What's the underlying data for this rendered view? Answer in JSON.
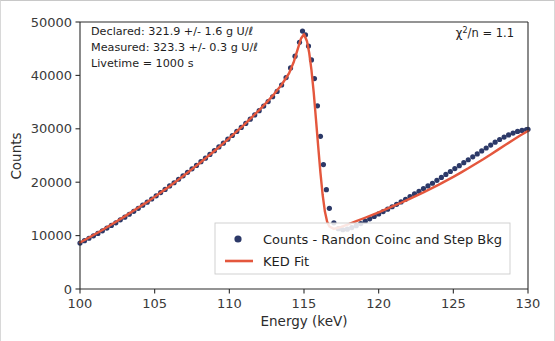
{
  "figure": {
    "background_color": "#ffffff",
    "axes_color": "#2b2b2b"
  },
  "chart_data": {
    "type": "line",
    "title": "",
    "xlabel": "Energy (keV)",
    "ylabel": "Counts",
    "xlim": [
      100,
      130
    ],
    "ylim": [
      0,
      50000
    ],
    "xticks": [
      100,
      105,
      110,
      115,
      120,
      125,
      130
    ],
    "yticks": [
      0,
      10000,
      20000,
      30000,
      40000,
      50000
    ],
    "xtick_labels": [
      "100",
      "105",
      "110",
      "115",
      "120",
      "125",
      "130"
    ],
    "ytick_labels": [
      "0",
      "10000",
      "20000",
      "30000",
      "40000",
      "50000"
    ],
    "grid": false,
    "legend_position": "lower center",
    "series": [
      {
        "name": "Counts - Randon Coinc and Step Bkg",
        "type": "scatter",
        "color": "#2c3968",
        "marker": "circle",
        "x": [
          100.0,
          100.3,
          100.6,
          100.9,
          101.2,
          101.5,
          101.8,
          102.1,
          102.4,
          102.7,
          103.0,
          103.3,
          103.6,
          103.9,
          104.2,
          104.5,
          104.8,
          105.1,
          105.4,
          105.7,
          106.0,
          106.3,
          106.6,
          106.9,
          107.2,
          107.5,
          107.8,
          108.1,
          108.4,
          108.7,
          109.0,
          109.3,
          109.6,
          109.9,
          110.2,
          110.5,
          110.8,
          111.1,
          111.4,
          111.7,
          112.0,
          112.3,
          112.6,
          112.9,
          113.2,
          113.5,
          113.8,
          114.1,
          114.4,
          114.7,
          114.9,
          115.1,
          115.3,
          115.5,
          115.7,
          115.9,
          116.1,
          116.3,
          116.5,
          116.7,
          117.0,
          117.3,
          117.6,
          117.9,
          118.2,
          118.5,
          118.8,
          119.1,
          119.4,
          119.7,
          120.0,
          120.3,
          120.6,
          120.9,
          121.2,
          121.5,
          121.8,
          122.1,
          122.4,
          122.7,
          123.0,
          123.3,
          123.6,
          123.9,
          124.2,
          124.5,
          124.8,
          125.1,
          125.4,
          125.7,
          126.0,
          126.3,
          126.6,
          126.9,
          127.2,
          127.5,
          127.8,
          128.1,
          128.4,
          128.7,
          129.0,
          129.3,
          129.6,
          129.9,
          130.0
        ],
        "y": [
          8600,
          9050,
          9500,
          9950,
          10400,
          10900,
          11400,
          11900,
          12400,
          12950,
          13450,
          14000,
          14550,
          15100,
          15700,
          16250,
          16850,
          17450,
          18050,
          18650,
          19300,
          19900,
          20550,
          21200,
          21850,
          22500,
          23150,
          23850,
          24500,
          25200,
          25900,
          26600,
          27300,
          28050,
          28750,
          29500,
          30250,
          31000,
          31800,
          32600,
          33400,
          34250,
          35100,
          36000,
          37000,
          38200,
          39600,
          41400,
          43600,
          46200,
          48300,
          47600,
          45500,
          42900,
          39400,
          34300,
          28600,
          23300,
          18600,
          15100,
          12400,
          11300,
          11100,
          11200,
          11500,
          11850,
          12250,
          12700,
          13150,
          13600,
          14050,
          14500,
          14950,
          15400,
          15850,
          16300,
          16800,
          17300,
          17800,
          18300,
          18800,
          19300,
          19800,
          20350,
          20900,
          21450,
          22000,
          22550,
          23100,
          23650,
          24200,
          24750,
          25300,
          25850,
          26400,
          26950,
          27500,
          28000,
          28450,
          28850,
          29200,
          29500,
          29700,
          29850,
          29900
        ]
      },
      {
        "name": "KED Fit",
        "type": "line",
        "color": "#e4573d",
        "x": [
          100.0,
          100.5,
          101.0,
          101.5,
          102.0,
          102.5,
          103.0,
          103.5,
          104.0,
          104.5,
          105.0,
          105.5,
          106.0,
          106.5,
          107.0,
          107.5,
          108.0,
          108.5,
          109.0,
          109.5,
          110.0,
          110.5,
          111.0,
          111.5,
          112.0,
          112.5,
          113.0,
          113.5,
          114.0,
          114.3,
          114.6,
          114.8,
          115.0,
          115.2,
          115.35,
          115.5,
          115.65,
          115.8,
          115.95,
          116.1,
          116.25,
          116.4,
          116.55,
          116.7,
          117.0,
          117.5,
          118.0,
          118.5,
          119.0,
          119.5,
          120.0,
          120.5,
          121.0,
          121.5,
          122.0,
          122.5,
          123.0,
          123.5,
          124.0,
          124.5,
          125.0,
          125.5,
          126.0,
          126.5,
          127.0,
          127.5,
          128.0,
          128.5,
          129.0,
          129.5,
          130.0
        ],
        "y": [
          8700,
          9450,
          10250,
          11050,
          11900,
          12750,
          13600,
          14500,
          15400,
          16300,
          17250,
          18250,
          19250,
          20300,
          21350,
          22450,
          23550,
          24700,
          25850,
          27050,
          28250,
          29500,
          30800,
          32150,
          33500,
          34950,
          36500,
          38250,
          40400,
          42400,
          45100,
          46900,
          47700,
          46400,
          44200,
          41000,
          36800,
          31800,
          26700,
          21800,
          17600,
          14500,
          12600,
          11700,
          11250,
          11650,
          12150,
          12700,
          13250,
          13800,
          14350,
          14950,
          15550,
          16150,
          16800,
          17450,
          18100,
          18800,
          19500,
          20250,
          21000,
          21800,
          22600,
          23450,
          24300,
          25200,
          26100,
          27000,
          27900,
          28800,
          29600
        ]
      }
    ],
    "annotations": [
      {
        "name": "stats-box",
        "position": "upper left",
        "lines": [
          "Declared:  321.9 +/- 1.6 g U/ℓ",
          "Measured:  323.3 +/- 0.3 g U/ℓ",
          "Livetime = 1000 s"
        ]
      },
      {
        "name": "chi-squared",
        "position": "upper right",
        "prefix": "χ",
        "superscript": "2",
        "suffix": "/n = 1.1",
        "text": "χ²/n = 1.1"
      }
    ],
    "legend": {
      "entries": [
        {
          "label": "Counts - Randon Coinc and Step Bkg",
          "marker": "circle",
          "color": "#2c3968"
        },
        {
          "label": "KED Fit",
          "marker": "line",
          "color": "#e4573d"
        }
      ]
    }
  }
}
